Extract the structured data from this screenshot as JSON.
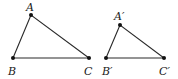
{
  "figure": {
    "triangles": [
      {
        "name": "ABC",
        "vertices": [
          {
            "label": "A",
            "x": 31,
            "y": 15,
            "label_x": 26,
            "label_y": 11
          },
          {
            "label": "B",
            "x": 13,
            "y": 58,
            "label_x": 8,
            "label_y": 75
          },
          {
            "label": "C",
            "x": 89,
            "y": 58,
            "label_x": 84,
            "label_y": 75
          }
        ]
      },
      {
        "name": "A'B'C'",
        "vertices": [
          {
            "label": "A′",
            "x": 120,
            "y": 25,
            "label_x": 114,
            "label_y": 20
          },
          {
            "label": "B′",
            "x": 106,
            "y": 58,
            "label_x": 102,
            "label_y": 75
          },
          {
            "label": "C′",
            "x": 164,
            "y": 58,
            "label_x": 159,
            "label_y": 75
          }
        ]
      }
    ]
  },
  "labels": {
    "A": "A",
    "B": "B",
    "C": "C",
    "A_prime": "A′",
    "B_prime": "B′",
    "C_prime": "C′"
  },
  "colors": {
    "line": "#2a2a2a",
    "point": "#111111",
    "background": "#ffffff"
  }
}
